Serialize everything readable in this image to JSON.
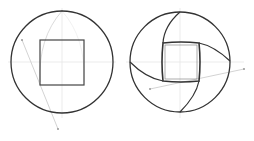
{
  "figure": {
    "colors": {
      "outline": "#333333",
      "construction": "#c8c8c8",
      "guide": "#e6e6e6"
    },
    "panels": [
      {
        "name": "left",
        "circle": {
          "cx": 62,
          "cy": 62,
          "r": 51
        },
        "square": {
          "x": 40,
          "y": 40,
          "w": 44,
          "h": 45
        }
      },
      {
        "name": "right",
        "circle": {
          "cx": 180,
          "cy": 62,
          "r": 50
        },
        "square": {
          "x": 163,
          "y": 43,
          "w": 36,
          "h": 38
        }
      }
    ]
  }
}
